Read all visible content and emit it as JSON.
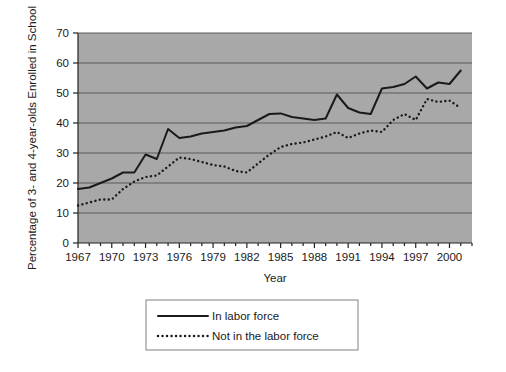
{
  "chart_data": {
    "type": "line",
    "title": "",
    "xlabel": "Year",
    "ylabel": "Percentage of 3- and 4-year-olds Enrolled in School",
    "xlim": [
      1967,
      2002
    ],
    "ylim": [
      0,
      70
    ],
    "ytick_labels": [
      "0",
      "10",
      "20",
      "30",
      "40",
      "50",
      "60",
      "70"
    ],
    "ytick_values": [
      0,
      10,
      20,
      30,
      40,
      50,
      60,
      70
    ],
    "xtick_labels": [
      "1967",
      "1970",
      "1973",
      "1976",
      "1979",
      "1982",
      "1985",
      "1988",
      "1991",
      "1994",
      "1997",
      "2000"
    ],
    "xtick_values": [
      1967,
      1970,
      1973,
      1976,
      1979,
      1982,
      1985,
      1988,
      1991,
      1994,
      1997,
      2000
    ],
    "grid": "horizontal",
    "legend_position": "below-bottom-center",
    "plot_background": "#a8a8a8",
    "figure_background": "#ffffff",
    "x": [
      1967,
      1968,
      1969,
      1970,
      1971,
      1972,
      1973,
      1974,
      1975,
      1976,
      1977,
      1978,
      1979,
      1980,
      1981,
      1982,
      1983,
      1984,
      1985,
      1986,
      1987,
      1988,
      1989,
      1990,
      1991,
      1992,
      1993,
      1994,
      1995,
      1996,
      1997,
      1998,
      1999,
      2000,
      2001
    ],
    "series": [
      {
        "name": "In labor force",
        "style": "solid",
        "color": "#1a1a1a",
        "values": [
          18.0,
          18.5,
          20.0,
          21.5,
          23.5,
          23.5,
          29.5,
          28.0,
          38.0,
          35.0,
          35.5,
          36.5,
          37.0,
          37.5,
          38.5,
          39.0,
          41.0,
          43.0,
          43.2,
          42.0,
          41.5,
          41.0,
          41.5,
          49.5,
          45.0,
          43.5,
          43.0,
          51.5,
          52.0,
          53.0,
          55.5,
          51.5,
          53.5,
          53.0,
          57.5
        ]
      },
      {
        "name": "Not in the labor force",
        "style": "dotted",
        "color": "#1a1a1a",
        "values": [
          12.5,
          13.5,
          14.5,
          14.5,
          18.0,
          20.5,
          22.0,
          22.5,
          25.5,
          28.5,
          28.0,
          27.0,
          26.0,
          25.5,
          24.0,
          23.5,
          26.5,
          29.5,
          32.0,
          33.0,
          33.5,
          34.5,
          35.5,
          37.0,
          35.0,
          36.5,
          37.5,
          37.0,
          41.0,
          43.0,
          41.0,
          48.0,
          47.0,
          47.5,
          45.0
        ]
      }
    ],
    "legend": [
      {
        "label": "In labor force",
        "style": "solid"
      },
      {
        "label": "Not in the labor force",
        "style": "dotted"
      }
    ]
  }
}
